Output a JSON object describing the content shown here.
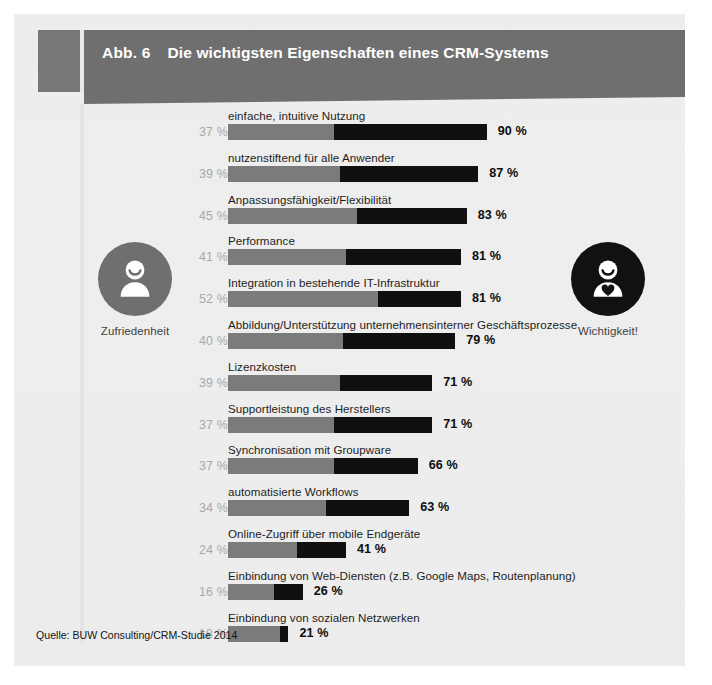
{
  "figure": {
    "number_label": "Abb. 6",
    "title": "Die wichtigsten Eigenschaften eines CRM-Systems",
    "source": "Quelle: BUW Consulting/CRM-Studie 2014"
  },
  "legend": {
    "left": {
      "caption": "Zufriedenheit",
      "icon": "person-smiling-icon",
      "color": "#6f6f6f"
    },
    "right": {
      "caption": "Wichtigkeit!",
      "icon": "person-with-heart-icon",
      "color": "#111111"
    }
  },
  "colors": {
    "header_band": "#6f6f6f",
    "panel": "#ededed",
    "satisfaction_bar": "#7b7b7b",
    "importance_bar": "#101010",
    "left_value_text": "#a8a8a8",
    "right_value_text": "#0d0d0d"
  },
  "chart_data": {
    "type": "bar",
    "orientation": "horizontal",
    "title": "Die wichtigsten Eigenschaften eines CRM-Systems",
    "subtitle": "Abb. 6",
    "xlabel": "",
    "ylabel": "",
    "xlim": [
      0,
      90
    ],
    "grid": false,
    "legend_position": "sides",
    "units": "%",
    "note": "Each row shows a grey segment (Zufriedenheit, satisfaction) drawn from 0, followed by a black segment extending to the total (Wichtigkeit, importance). Bar length is proportional to the importance value.",
    "categories": [
      "einfache, intuitive Nutzung",
      "nutzenstiftend für alle Anwender",
      "Anpassungsfähigkeit/Flexibilität",
      "Performance",
      "Integration in bestehende IT-Infrastruktur",
      "Abbildung/Unterstützung unternehmensinterner Geschäftsprozesse",
      "Lizenzkosten",
      "Supportleistung des Herstellers",
      "Synchronisation mit Groupware",
      "automatisierte Workflows",
      "Online-Zugriff über mobile Endgeräte",
      "Einbindung von Web-Diensten (z.B. Google Maps, Routenplanung)",
      "Einbindung von sozialen Netzwerken"
    ],
    "series": [
      {
        "name": "Zufriedenheit",
        "color": "#7b7b7b",
        "values": [
          37,
          39,
          45,
          41,
          52,
          40,
          39,
          37,
          37,
          34,
          24,
          16,
          18
        ]
      },
      {
        "name": "Wichtigkeit!",
        "color": "#101010",
        "values": [
          90,
          87,
          83,
          81,
          81,
          79,
          71,
          71,
          66,
          63,
          41,
          26,
          21
        ]
      }
    ],
    "rows": [
      {
        "label": "einfache, intuitive Nutzung",
        "satisfaction": 37,
        "satisfaction_text": "37 %",
        "importance": 90,
        "importance_text": "90 %"
      },
      {
        "label": "nutzenstiftend für alle Anwender",
        "satisfaction": 39,
        "satisfaction_text": "39 %",
        "importance": 87,
        "importance_text": "87 %"
      },
      {
        "label": "Anpassungsfähigkeit/Flexibilität",
        "satisfaction": 45,
        "satisfaction_text": "45 %",
        "importance": 83,
        "importance_text": "83 %"
      },
      {
        "label": "Performance",
        "satisfaction": 41,
        "satisfaction_text": "41 %",
        "importance": 81,
        "importance_text": "81 %"
      },
      {
        "label": "Integration in bestehende IT-Infrastruktur",
        "satisfaction": 52,
        "satisfaction_text": "52 %",
        "importance": 81,
        "importance_text": "81 %"
      },
      {
        "label": "Abbildung/Unterstützung unternehmensinterner Geschäftsprozesse",
        "satisfaction": 40,
        "satisfaction_text": "40 %",
        "importance": 79,
        "importance_text": "79 %"
      },
      {
        "label": "Lizenzkosten",
        "satisfaction": 39,
        "satisfaction_text": "39 %",
        "importance": 71,
        "importance_text": "71 %"
      },
      {
        "label": "Supportleistung des Herstellers",
        "satisfaction": 37,
        "satisfaction_text": "37 %",
        "importance": 71,
        "importance_text": "71 %"
      },
      {
        "label": "Synchronisation mit Groupware",
        "satisfaction": 37,
        "satisfaction_text": "37 %",
        "importance": 66,
        "importance_text": "66 %"
      },
      {
        "label": "automatisierte Workflows",
        "satisfaction": 34,
        "satisfaction_text": "34 %",
        "importance": 63,
        "importance_text": "63 %"
      },
      {
        "label": "Online-Zugriff über mobile Endgeräte",
        "satisfaction": 24,
        "satisfaction_text": "24 %",
        "importance": 41,
        "importance_text": "41 %"
      },
      {
        "label": "Einbindung von Web-Diensten (z.B. Google Maps, Routenplanung)",
        "satisfaction": 16,
        "satisfaction_text": "16 %",
        "importance": 26,
        "importance_text": "26 %"
      },
      {
        "label": "Einbindung von sozialen Netzwerken",
        "satisfaction": 18,
        "satisfaction_text": "18 %",
        "importance": 21,
        "importance_text": "21 %"
      }
    ]
  }
}
